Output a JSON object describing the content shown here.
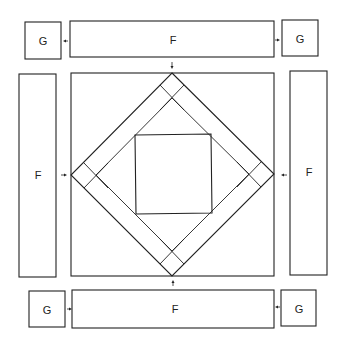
{
  "diagram": {
    "type": "quilt-block-assembly",
    "center_block": {
      "outer_square": {
        "x1": 71,
        "y1": 73,
        "x2": 274,
        "y2": 276
      },
      "outer_diamond": [
        [
          172,
          73
        ],
        [
          274,
          174
        ],
        [
          172,
          276
        ],
        [
          71,
          175
        ]
      ],
      "inner_diamond": [
        [
          172,
          98
        ],
        [
          249,
          174
        ],
        [
          172,
          251
        ],
        [
          96,
          175
        ]
      ],
      "inner_square": {
        "x1": 135,
        "y1": 135,
        "x2": 211,
        "y2": 213
      }
    },
    "pieces": {
      "top_left_g": {
        "label": "G",
        "x": 25,
        "y": 22,
        "w": 36,
        "h": 37
      },
      "top_f": {
        "label": "F",
        "x": 70,
        "y": 21,
        "w": 204,
        "h": 36
      },
      "top_right_g": {
        "label": "G",
        "x": 282,
        "y": 20,
        "w": 36,
        "h": 36
      },
      "left_f": {
        "label": "F",
        "x": 19,
        "y": 74,
        "w": 37,
        "h": 203
      },
      "right_f": {
        "label": "F",
        "x": 290,
        "y": 71,
        "w": 37,
        "h": 204
      },
      "bottom_left_g": {
        "label": "G",
        "x": 29,
        "y": 291,
        "w": 36,
        "h": 36
      },
      "bottom_f": {
        "label": "F",
        "x": 72,
        "y": 290,
        "w": 202,
        "h": 38
      },
      "bottom_right_g": {
        "label": "G",
        "x": 281,
        "y": 290,
        "w": 35,
        "h": 36
      }
    },
    "arrows": [
      {
        "name": "top-left-g-arrow",
        "direction": "left"
      },
      {
        "name": "top-right-g-arrow",
        "direction": "right"
      },
      {
        "name": "top-f-arrow",
        "direction": "down"
      },
      {
        "name": "left-f-arrow",
        "direction": "right"
      },
      {
        "name": "right-f-arrow",
        "direction": "left"
      },
      {
        "name": "bottom-f-arrow",
        "direction": "up"
      },
      {
        "name": "bottom-left-g-arrow",
        "direction": "right"
      },
      {
        "name": "bottom-right-g-arrow",
        "direction": "left"
      }
    ]
  }
}
